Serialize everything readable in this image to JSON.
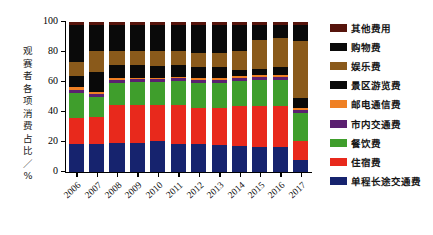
{
  "chart_data": {
    "type": "bar",
    "subtype": "stacked-bar-100-percent",
    "title": "",
    "xlabel": "",
    "ylabel": "观赛者各项消费占比 / %",
    "ylabel_chars": [
      "观",
      "赛",
      "者",
      "各",
      "项",
      "消",
      "费",
      "占",
      "比",
      "／",
      "%"
    ],
    "ylim": [
      0,
      100
    ],
    "yticks": [
      0,
      20,
      40,
      60,
      80,
      100
    ],
    "ytick_labels": [
      "0",
      "20",
      "40",
      "60",
      "80",
      "100"
    ],
    "grid": false,
    "legend_position": "right",
    "categories": [
      "2006",
      "2007",
      "2008",
      "2009",
      "2010",
      "2011",
      "2012",
      "2013",
      "2014",
      "2015",
      "2016",
      "2017"
    ],
    "series": [
      {
        "name": "单程长途交通费",
        "color": "#16236e",
        "values": [
          19.0,
          19.0,
          19.5,
          19.5,
          20.5,
          19.0,
          18.5,
          18.0,
          17.5,
          17.0,
          16.5,
          8.0
        ]
      },
      {
        "name": "住宿费",
        "color": "#e8291c",
        "values": [
          17.0,
          18.0,
          25.5,
          25.5,
          24.5,
          26.0,
          24.5,
          25.0,
          26.5,
          27.0,
          27.5,
          13.0
        ]
      },
      {
        "name": "餐饮费",
        "color": "#3f9e2c",
        "values": [
          17.0,
          13.0,
          14.5,
          15.0,
          15.0,
          15.5,
          16.5,
          16.5,
          17.0,
          17.5,
          17.5,
          18.5
        ]
      },
      {
        "name": "市内交通费",
        "color": "#5b2070",
        "values": [
          2.0,
          2.0,
          2.0,
          2.0,
          2.0,
          2.0,
          2.0,
          2.0,
          2.0,
          2.0,
          2.0,
          2.0
        ]
      },
      {
        "name": "邮电通信费",
        "color": "#ef8024",
        "values": [
          1.5,
          1.5,
          1.0,
          1.0,
          1.0,
          1.0,
          1.0,
          1.0,
          1.0,
          1.0,
          1.0,
          1.0
        ]
      },
      {
        "name": "景区游览费",
        "color": "#090909",
        "values": [
          7.5,
          13.0,
          9.0,
          8.5,
          8.0,
          8.0,
          7.5,
          7.5,
          4.0,
          4.5,
          5.5,
          7.0
        ]
      },
      {
        "name": "娱乐费",
        "color": "#8a5a1b",
        "values": [
          9.5,
          14.0,
          9.5,
          9.5,
          10.0,
          9.5,
          9.5,
          9.5,
          12.5,
          19.0,
          19.5,
          38.0
        ]
      },
      {
        "name": "购物费",
        "color": "#0a0a0a",
        "values": [
          24.5,
          17.5,
          17.0,
          17.0,
          17.0,
          17.0,
          18.5,
          18.5,
          17.5,
          10.0,
          8.5,
          10.5
        ]
      },
      {
        "name": "其他费用",
        "color": "#56140c",
        "values": [
          2.0,
          2.0,
          2.0,
          2.0,
          2.0,
          2.0,
          2.0,
          2.0,
          2.0,
          2.0,
          2.0,
          2.0
        ]
      }
    ]
  },
  "legend": {
    "items": [
      {
        "label": "其他费用",
        "color": "#56140c"
      },
      {
        "label": "购物费",
        "color": "#0a0a0a"
      },
      {
        "label": "娱乐费",
        "color": "#8a5a1b"
      },
      {
        "label": "景区游览费",
        "color": "#090909"
      },
      {
        "label": "邮电通信费",
        "color": "#ef8024"
      },
      {
        "label": "市内交通费",
        "color": "#5b2070"
      },
      {
        "label": "餐饮费",
        "color": "#3f9e2c"
      },
      {
        "label": "住宿费",
        "color": "#e8291c"
      },
      {
        "label": "单程长途交通费",
        "color": "#16236e"
      }
    ]
  },
  "colors": {
    "background": "#ffffff",
    "axis": "#000000",
    "text": "#111111"
  }
}
